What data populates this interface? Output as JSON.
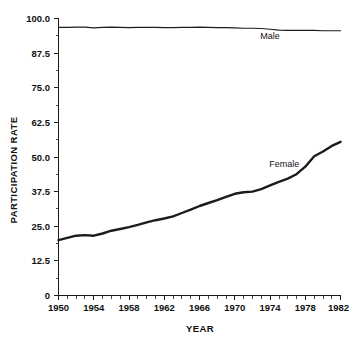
{
  "chart_data": {
    "type": "line",
    "title": "",
    "xlabel": "YEAR",
    "ylabel": "PARTICIPATION RATE",
    "xlim": [
      1950,
      1982
    ],
    "ylim": [
      0,
      100
    ],
    "grid": false,
    "legend_position": "inline-annotation",
    "x_ticks": [
      1950,
      1954,
      1958,
      1962,
      1966,
      1970,
      1974,
      1978,
      1982
    ],
    "x_tick_labels": [
      "1950",
      "1954",
      "1958",
      "1962",
      "1966",
      "1970",
      "1974",
      "1978",
      "1982"
    ],
    "x_minor_tick_step": 1,
    "y_ticks": [
      0,
      12.5,
      25.0,
      37.5,
      50.0,
      62.5,
      75.0,
      87.5,
      100.0
    ],
    "y_tick_labels": [
      "0",
      "12.5",
      "25.0",
      "37.5",
      "50.0",
      "62.5",
      "75.0",
      "87.5",
      "100.0"
    ],
    "x": [
      1950,
      1951,
      1952,
      1953,
      1954,
      1955,
      1956,
      1957,
      1958,
      1959,
      1960,
      1961,
      1962,
      1963,
      1964,
      1965,
      1966,
      1967,
      1968,
      1969,
      1970,
      1971,
      1972,
      1973,
      1974,
      1975,
      1976,
      1977,
      1978,
      1979,
      1980,
      1981,
      1982
    ],
    "series": [
      {
        "name": "Male",
        "label": "Male",
        "color": "#1c1c1c",
        "line_width": 1.1,
        "annotation": {
          "text": "Male",
          "x": 1974.0,
          "y": 92.6
        },
        "values": [
          96.8,
          96.8,
          96.9,
          96.9,
          96.6,
          96.8,
          96.9,
          96.8,
          96.7,
          96.8,
          96.8,
          96.8,
          96.7,
          96.7,
          96.8,
          96.8,
          96.9,
          96.8,
          96.7,
          96.7,
          96.6,
          96.5,
          96.5,
          96.4,
          96.1,
          95.8,
          95.7,
          95.7,
          95.7,
          95.7,
          95.6,
          95.6,
          95.6
        ]
      },
      {
        "name": "Female",
        "label": "Female",
        "color": "#1c1c1c",
        "line_width": 2.4,
        "annotation": {
          "text": "Female",
          "x": 1975.6,
          "y": 46.5
        },
        "values": [
          20.0,
          20.8,
          21.6,
          21.8,
          21.6,
          22.4,
          23.4,
          24.0,
          24.7,
          25.5,
          26.4,
          27.2,
          27.8,
          28.6,
          29.8,
          31.0,
          32.3,
          33.4,
          34.4,
          35.6,
          36.7,
          37.3,
          37.5,
          38.4,
          39.8,
          41.0,
          42.2,
          43.8,
          46.5,
          50.3,
          52.0,
          54.0,
          55.5
        ]
      }
    ],
    "female_values_note": "Female series continues rising to about 65 by 1982",
    "female_values_full": [
      20.0,
      20.8,
      21.6,
      21.8,
      21.6,
      22.4,
      23.4,
      24.0,
      24.7,
      25.5,
      26.4,
      27.2,
      27.8,
      28.6,
      29.8,
      31.0,
      32.3,
      33.4,
      34.4,
      35.6,
      36.7,
      37.3,
      37.5,
      38.4,
      39.8,
      41.0,
      42.2,
      43.8,
      46.5,
      50.3,
      52.0,
      54.0,
      55.5
    ]
  },
  "axes": {
    "x_title": "YEAR",
    "y_title": "PARTICIPATION RATE"
  },
  "labels": {
    "male": "Male",
    "female": "Female"
  },
  "ticks": {
    "y": [
      "100.0",
      "87.5",
      "75.0",
      "62.5",
      "50.0",
      "37.5",
      "25.0",
      "12.5",
      "0"
    ],
    "x": [
      "1950",
      "1954",
      "1958",
      "1962",
      "1966",
      "1970",
      "1974",
      "1978",
      "1982"
    ]
  }
}
